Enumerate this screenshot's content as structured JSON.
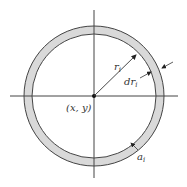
{
  "diagram": {
    "labels": {
      "radius": "r",
      "radius_sub": "i",
      "thickness": "dr",
      "thickness_sub": "i",
      "center": "(x, y)",
      "area": "a",
      "area_sub": "i"
    },
    "colors": {
      "ring_fill": "#d9d9d9",
      "stroke": "#333333",
      "background": "#ffffff"
    }
  }
}
